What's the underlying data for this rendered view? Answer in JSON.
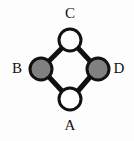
{
  "figure": {
    "type": "graph-diagram",
    "background_color": "#fdfdfd",
    "width": 134,
    "height": 141,
    "edge_color": "#111111",
    "edge_width": 5,
    "node_outline_color": "#111111",
    "node_outline_width": 3,
    "node_radius": 11,
    "fill_white": "#ffffff",
    "fill_gray": "#808080"
  },
  "graph": {
    "nodes": [
      {
        "id": "C",
        "label": "C",
        "cx": 70,
        "cy": 40,
        "r": 11,
        "fill": "#ffffff",
        "state": "unfilled",
        "label_position": "above"
      },
      {
        "id": "B",
        "label": "B",
        "cx": 41,
        "cy": 69,
        "r": 11,
        "fill": "#808080",
        "state": "filled",
        "label_position": "left"
      },
      {
        "id": "D",
        "label": "D",
        "cx": 98,
        "cy": 69,
        "r": 11,
        "fill": "#808080",
        "state": "filled",
        "label_position": "right"
      },
      {
        "id": "A",
        "label": "A",
        "cx": 70,
        "cy": 99,
        "r": 11,
        "fill": "#ffffff",
        "state": "unfilled",
        "label_position": "below"
      }
    ],
    "edges": [
      {
        "from": "C",
        "to": "B",
        "x1": 62,
        "y1": 48,
        "x2": 49,
        "y2": 61
      },
      {
        "from": "C",
        "to": "D",
        "x1": 78,
        "y1": 48,
        "x2": 90,
        "y2": 61
      },
      {
        "from": "B",
        "to": "A",
        "x1": 49,
        "y1": 77,
        "x2": 62,
        "y2": 91
      },
      {
        "from": "D",
        "to": "A",
        "x1": 90,
        "y1": 77,
        "x2": 78,
        "y2": 91
      }
    ]
  }
}
